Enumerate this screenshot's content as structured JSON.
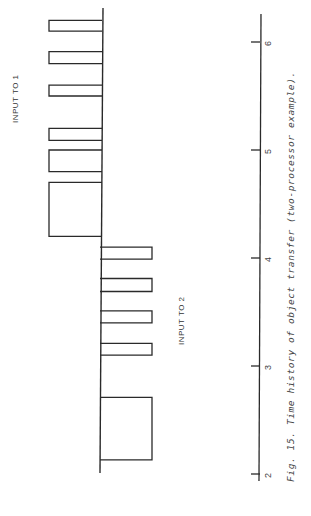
{
  "chart_data": {
    "type": "bar",
    "orientation": "rotated 90deg (time axis vertical, increasing upward)",
    "title": "Fig. 15.  Time history of object transfer (two-processor example).",
    "xlabel": "time",
    "ylabel": "",
    "xlim": [
      2,
      6.3
    ],
    "ticks": [
      2,
      3,
      4,
      5,
      6
    ],
    "grid": false,
    "series": [
      {
        "name": "INPUT TO 1",
        "side": "left of baseline",
        "intervals": [
          [
            4.2,
            4.7
          ],
          [
            4.8,
            5.0
          ],
          [
            5.09,
            5.2
          ],
          [
            5.5,
            5.6
          ],
          [
            5.8,
            5.91
          ],
          [
            6.1,
            6.2
          ]
        ],
        "height": 1
      },
      {
        "name": "INPUT TO 2",
        "side": "right of baseline",
        "intervals": [
          [
            2.13,
            2.71
          ],
          [
            3.1,
            3.21
          ],
          [
            3.4,
            3.51
          ],
          [
            3.69,
            3.81
          ],
          [
            3.99,
            4.1
          ]
        ],
        "height": 1
      }
    ]
  },
  "labels": {
    "input1": "INPUT TO 1",
    "input2": "INPUT TO 2",
    "caption": "Fig. 15.  Time history of object transfer (two-processor example).",
    "ticks": [
      "2",
      "3",
      "4",
      "5",
      "6"
    ]
  },
  "colors": {
    "ink": "#2a2a2a",
    "background": "#ffffff"
  }
}
